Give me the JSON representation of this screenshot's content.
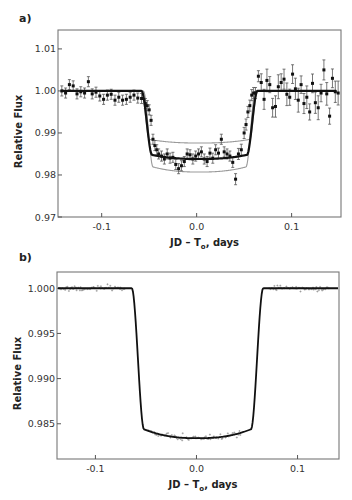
{
  "chart_data": [
    {
      "panel": "a)",
      "type": "line",
      "title": "",
      "xlabel": "JD – T₀, days",
      "xlabel_main": "JD – T",
      "xlabel_sub": "o",
      "xlabel_tail": ", days",
      "ylabel": "Relative Flux",
      "xlim": [
        -0.146,
        0.152
      ],
      "ylim": [
        0.97,
        1.0145
      ],
      "xticks": [
        -0.1,
        0.0,
        0.1
      ],
      "xtick_labels": [
        "-0.1",
        "0.0",
        "0.1"
      ],
      "yticks": [
        0.97,
        0.98,
        0.99,
        1.0,
        1.01
      ],
      "ytick_labels": [
        "0.97",
        "0.98",
        "0.99",
        "1.00",
        "1.01"
      ],
      "grid": false,
      "legend": null,
      "series": [
        {
          "name": "best-fit model",
          "color": "#111111",
          "width": 2.2,
          "t1": -0.058,
          "t2": -0.047,
          "t3": 0.053,
          "t4": 0.064,
          "depth": 0.0162
        },
        {
          "name": "model (shallow)",
          "color": "#9a9a9a",
          "width": 1.1,
          "t1": -0.058,
          "t2": -0.05,
          "t3": 0.056,
          "t4": 0.064,
          "depth": 0.0124
        },
        {
          "name": "model (deep)",
          "color": "#9a9a9a",
          "width": 1.1,
          "t1": -0.056,
          "t2": -0.046,
          "t3": 0.052,
          "t4": 0.062,
          "depth": 0.0193
        }
      ],
      "points": {
        "name": "observed flux",
        "x": [
          -0.142,
          -0.138,
          -0.134,
          -0.13,
          -0.126,
          -0.122,
          -0.118,
          -0.114,
          -0.11,
          -0.106,
          -0.102,
          -0.098,
          -0.094,
          -0.09,
          -0.086,
          -0.082,
          -0.078,
          -0.074,
          -0.07,
          -0.066,
          -0.062,
          -0.058,
          -0.054,
          -0.052,
          -0.05,
          -0.048,
          -0.046,
          -0.044,
          -0.042,
          -0.04,
          -0.037,
          -0.034,
          -0.031,
          -0.028,
          -0.025,
          -0.022,
          -0.019,
          -0.016,
          -0.013,
          -0.01,
          -0.007,
          -0.004,
          -0.001,
          0.002,
          0.005,
          0.008,
          0.011,
          0.014,
          0.017,
          0.02,
          0.023,
          0.026,
          0.029,
          0.032,
          0.035,
          0.038,
          0.041,
          0.044,
          0.047,
          0.05,
          0.052,
          0.054,
          0.056,
          0.058,
          0.06,
          0.062,
          0.065,
          0.068,
          0.071,
          0.074,
          0.077,
          0.08,
          0.083,
          0.086,
          0.089,
          0.092,
          0.095,
          0.098,
          0.101,
          0.104,
          0.107,
          0.11,
          0.113,
          0.116,
          0.119,
          0.122,
          0.125,
          0.128,
          0.131,
          0.134,
          0.137,
          0.14,
          0.143,
          0.146,
          0.149
        ],
        "y": [
          1.0,
          0.9995,
          1.0015,
          1.0012,
          0.9993,
          0.9998,
          0.9995,
          1.0022,
          0.9993,
          0.9997,
          0.9988,
          0.998,
          0.999,
          0.9992,
          0.9978,
          0.9985,
          0.9978,
          0.998,
          0.9985,
          0.999,
          0.9983,
          0.9982,
          0.997,
          0.9965,
          0.9955,
          0.993,
          0.9885,
          0.987,
          0.986,
          0.985,
          0.9845,
          0.9838,
          0.985,
          0.984,
          0.9842,
          0.9825,
          0.9815,
          0.9822,
          0.9832,
          0.985,
          0.9848,
          0.9838,
          0.9845,
          0.985,
          0.9855,
          0.9838,
          0.9832,
          0.9852,
          0.984,
          0.986,
          0.9852,
          0.9885,
          0.9855,
          0.985,
          0.9845,
          0.983,
          0.979,
          0.985,
          0.986,
          0.99,
          0.992,
          0.995,
          0.9965,
          0.999,
          0.9995,
          0.9995,
          1.0035,
          1.002,
          0.998,
          1.0025,
          1.0015,
          0.996,
          0.9963,
          1.001,
          1.002,
          1.0028,
          0.9992,
          0.9985,
          1.004,
          1.0005,
          0.9978,
          1.0015,
          0.997,
          0.9985,
          0.995,
          1.0018,
          0.9972,
          0.996,
          0.9995,
          1.005,
          0.9993,
          0.994,
          1.003,
          0.9998,
          0.9995
        ],
        "yerr": 0.0012,
        "marker": "square",
        "color": "#111111",
        "errorbar_color": "#555555"
      }
    },
    {
      "panel": "b)",
      "type": "line",
      "title": "",
      "xlabel": "JD – T₀, days",
      "xlabel_main": "JD – T",
      "xlabel_sub": "o",
      "xlabel_tail": ", days",
      "ylabel": "Relative Flux",
      "xlim": [
        -0.138,
        0.141
      ],
      "ylim": [
        0.9811,
        1.0018
      ],
      "xticks": [
        -0.1,
        0.0,
        0.1
      ],
      "xtick_labels": [
        "-0.1",
        "0.0",
        "0.1"
      ],
      "yticks": [
        0.985,
        0.99,
        0.995,
        1.0
      ],
      "ytick_labels": [
        "0.985",
        "0.990",
        "0.995",
        "1.000"
      ],
      "grid": false,
      "legend": null,
      "series": [
        {
          "name": "best-fit model",
          "color": "#111111",
          "width": 1.8,
          "t1": -0.064,
          "t2": -0.052,
          "t3": 0.054,
          "t4": 0.066,
          "depth": 0.0166
        }
      ],
      "points": {
        "name": "high-precision photometry",
        "x_ranges": [
          [
            -0.135,
            -0.07
          ],
          [
            -0.048,
            0.045
          ],
          [
            0.072,
            0.132
          ]
        ],
        "scatter": 0.00015,
        "color": "#8a8a8a"
      }
    }
  ],
  "labels": {
    "panel_a": "a)",
    "panel_b": "b)"
  }
}
